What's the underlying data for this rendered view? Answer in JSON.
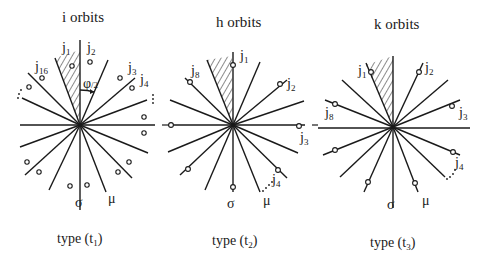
{
  "panels": [
    {
      "title": "i orbits",
      "caption": "type (t",
      "caption_sub": "1",
      "labels": {
        "j1": "j",
        "j1_sub": "1",
        "j2": "j",
        "j2_sub": "2",
        "j3": "j",
        "j3_sub": "3",
        "j4": "j",
        "j4_sub": "4",
        "j16": "j",
        "j16_sub": "16",
        "phi": "φ",
        "phi_den": "/2",
        "sigma": "σ",
        "mu": "μ"
      }
    },
    {
      "title": "h orbits",
      "caption": "type (t",
      "caption_sub": "2",
      "labels": {
        "j1": "j",
        "j1_sub": "1",
        "j2": "j",
        "j2_sub": "2",
        "j3": "j",
        "j3_sub": "3",
        "j4": "j",
        "j4_sub": "4",
        "j8": "j",
        "j8_sub": "8",
        "sigma": "σ",
        "mu": "μ"
      }
    },
    {
      "title": "k orbits",
      "caption": "type (t",
      "caption_sub": "3",
      "labels": {
        "j1": "j",
        "j1_sub": "1",
        "j2": "j",
        "j2_sub": "2",
        "j3": "j",
        "j3_sub": "3",
        "j4": "j",
        "j4_sub": "4",
        "j8": "j",
        "j8_sub": "8",
        "sigma": "σ",
        "mu": "μ"
      }
    }
  ],
  "caption_close": ")"
}
